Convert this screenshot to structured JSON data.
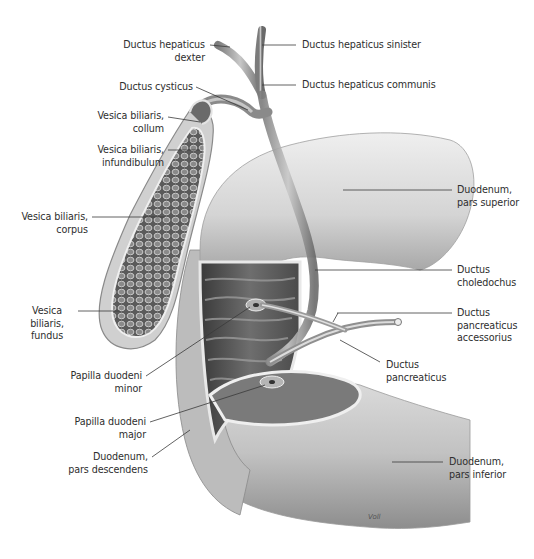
{
  "figure": {
    "signature": "Voll",
    "colors": {
      "background": "#ffffff",
      "label_text": "#2e2e2e",
      "leader_line": "#3a3a3a",
      "tissue_light": "#e6e6e6",
      "tissue_mid": "#bdbdbd",
      "tissue_dark": "#4a4a4a"
    }
  },
  "labels": {
    "ductus_hepaticus_dexter": "Ductus hepaticus\ndexter",
    "ductus_hepaticus_sinister": "Ductus hepaticus sinister",
    "ductus_cysticus": "Ductus cysticus",
    "ductus_hepaticus_communis": "Ductus hepaticus communis",
    "vesica_biliaris_collum": "Vesica biliaris,\ncollum",
    "vesica_biliaris_infundibulum": "Vesica biliaris,\ninfundibulum",
    "duodenum_pars_superior": "Duodenum,\npars superior",
    "vesica_biliaris_corpus": "Vesica biliaris,\ncorpus",
    "ductus_choledochus": "Ductus\ncholedochus",
    "vesica_biliaris_fundus": "Vesica\nbiliaris,\nfundus",
    "ductus_pancreaticus_accessorius": "Ductus\npancreaticus\naccessorius",
    "papilla_duodeni_minor": "Papilla duodeni\nminor",
    "ductus_pancreaticus": "Ductus\npancreaticus",
    "papilla_duodeni_major": "Papilla duodeni\nmajor",
    "duodenum_pars_descendens": "Duodenum,\npars descendens",
    "duodenum_pars_inferior": "Duodenum,\npars inferior"
  }
}
